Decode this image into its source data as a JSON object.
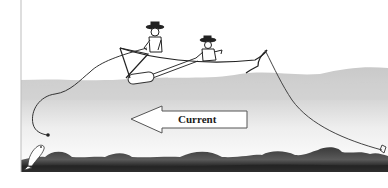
{
  "diagram": {
    "title": "",
    "arrow_label": "Current",
    "arrow_direction": "left",
    "elements": [
      "boat",
      "fisherman-standing",
      "fisherman-seated",
      "oar",
      "fishing-line-left",
      "fishing-line-right",
      "fish",
      "hook-weight",
      "riverbed",
      "water-surface",
      "current-arrow"
    ],
    "colors": {
      "background": "#ffffff",
      "water_top": "#c8c8c8",
      "water_mid": "#e6e6e6",
      "riverbed": "#2e2e2e",
      "lines": "#333333",
      "arrow_fill": "#ffffff",
      "arrow_stroke": "#444444"
    }
  }
}
